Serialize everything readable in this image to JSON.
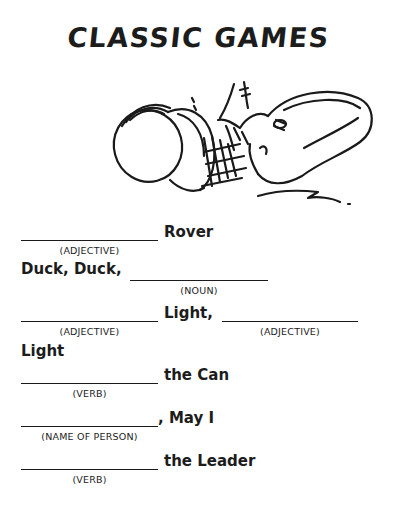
{
  "page": {
    "title": "CLASSIC GAMES",
    "illustration": "kick-the-can-illustration"
  },
  "items": [
    {
      "blanks": [
        {
          "hint": "(ADJECTIVE)"
        }
      ],
      "text": "Rover"
    },
    {
      "prefix": "Duck, Duck,",
      "blanks": [
        {
          "hint": "(NOUN)"
        }
      ]
    },
    {
      "blanks": [
        {
          "hint": "(ADJECTIVE)"
        },
        {
          "hint": "(ADJECTIVE)"
        }
      ],
      "middle": "Light,",
      "continuation": "Light"
    },
    {
      "blanks": [
        {
          "hint": "(VERB)"
        }
      ],
      "text": "the Can"
    },
    {
      "blanks": [
        {
          "hint": "(NAME OF PERSON)"
        }
      ],
      "text": ", May I"
    },
    {
      "blanks": [
        {
          "hint": "(VERB)"
        }
      ],
      "text": "the Leader"
    }
  ]
}
